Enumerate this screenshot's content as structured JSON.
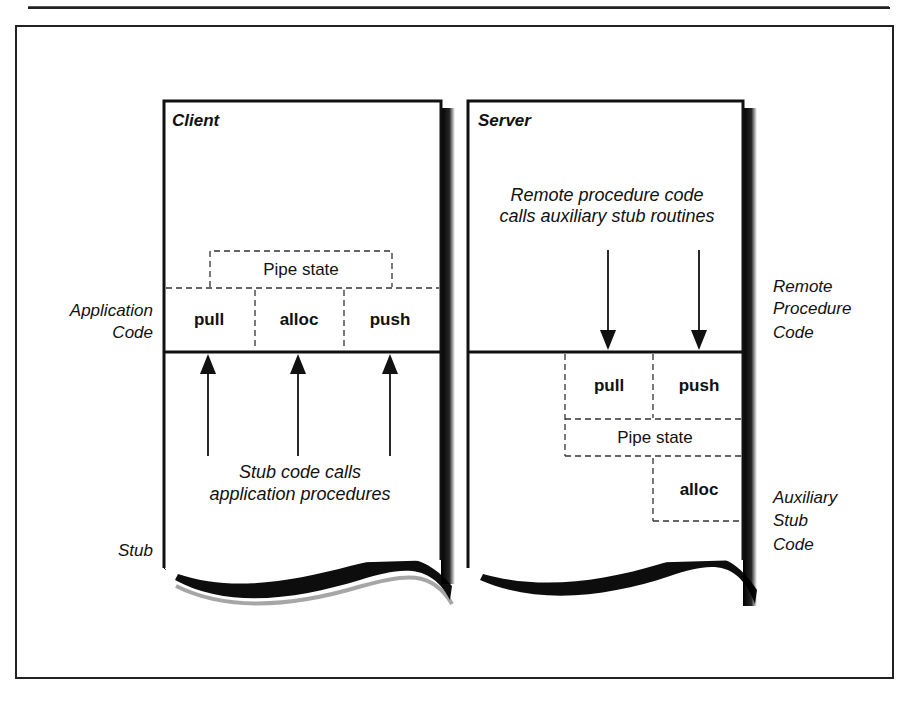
{
  "figure": {
    "colors": {
      "ink": "#111111",
      "paper": "#ffffff",
      "dash": "#333333"
    },
    "client": {
      "title": "Client",
      "side_labels": {
        "application_code": [
          "Application",
          "Code"
        ],
        "stub": "Stub"
      },
      "pipe_state": "Pipe state",
      "cells": [
        "pull",
        "alloc",
        "push"
      ],
      "arrow_direction": "up",
      "arrow_count": 3,
      "caption": [
        "Stub code calls",
        "application procedures"
      ]
    },
    "server": {
      "title": "Server",
      "caption": [
        "Remote procedure code",
        "calls auxiliary stub routines"
      ],
      "arrow_direction": "down",
      "arrow_count": 2,
      "cells": [
        "pull",
        "push"
      ],
      "pipe_state": "Pipe state",
      "alloc": "alloc",
      "side_labels": {
        "remote_procedure_code": [
          "Remote",
          "Procedure",
          "Code"
        ],
        "auxiliary_stub_code": [
          "Auxiliary",
          "Stub",
          "Code"
        ]
      }
    }
  }
}
